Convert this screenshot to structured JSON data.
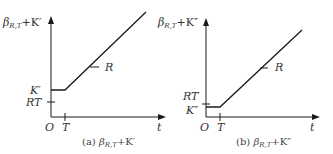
{
  "panels": [
    {
      "id": "a",
      "y_axis_label": {
        "main": "β",
        "sub": "R,T",
        "rest": "+K′"
      },
      "x_axis_label": "t",
      "origin_label": "O",
      "t_tick_label": "T",
      "level_label": "K′",
      "rt_label": "RT",
      "slope_label": "R",
      "caption": {
        "prefix": "(a) ",
        "main": "β",
        "sub": "R,T",
        "rest": "+K′"
      },
      "note": "K′ above RT"
    },
    {
      "id": "b",
      "y_axis_label": {
        "main": "β",
        "sub": "R,T",
        "rest": "+K″"
      },
      "x_axis_label": "t",
      "origin_label": "O",
      "t_tick_label": "T",
      "level_label": "K″",
      "rt_label": "RT",
      "slope_label": "R",
      "caption": {
        "prefix": "(b) ",
        "main": "β",
        "sub": "R,T",
        "rest": "+K″"
      },
      "note": "K″ below RT"
    }
  ],
  "colors": {
    "line": "#1a1a1a",
    "text": "#333333"
  }
}
